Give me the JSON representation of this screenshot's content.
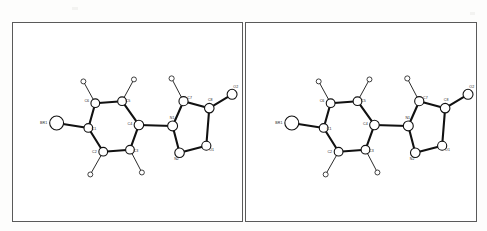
{
  "figure": {
    "type": "ortep-stereo-pair",
    "panel_count": 2,
    "background_color": "#fdfdfc",
    "frame_color": "#5a5a5a",
    "bond_color": "#111111",
    "atom_fill_color": "#ffffff"
  },
  "panels": [
    {
      "id": "panel-left",
      "name": "stereo-view-left"
    },
    {
      "id": "panel-right",
      "name": "stereo-view-right"
    }
  ],
  "molecule": {
    "labels": {
      "br1": "BR1",
      "c1": "C1",
      "c2": "C2",
      "c3": "C3",
      "c4": "C4",
      "c5": "C5",
      "c6": "C6",
      "c7": "C7",
      "c8": "C8",
      "n1": "N1",
      "n2": "N2",
      "o1": "O1",
      "o2": "O2"
    },
    "atoms": [
      {
        "key": "br1",
        "label": "BR1",
        "element": "Br",
        "radius": 7.0,
        "x": 44,
        "y": 101,
        "label_dx": -13,
        "label_dy": 1.2,
        "kind": "br"
      },
      {
        "key": "c1",
        "label": "C1",
        "element": "C",
        "radius": 4.4,
        "x": 76,
        "y": 106,
        "label_dx": 5.6,
        "label_dy": 2.2,
        "kind": "c"
      },
      {
        "key": "c6",
        "label": "C6",
        "element": "C",
        "radius": 4.4,
        "x": 83,
        "y": 81,
        "label_dx": -8.6,
        "label_dy": -1.0,
        "kind": "c"
      },
      {
        "key": "c5",
        "label": "C5",
        "element": "C",
        "radius": 4.4,
        "x": 110,
        "y": 79,
        "label_dx": 6.0,
        "label_dy": 0.5,
        "kind": "c"
      },
      {
        "key": "c4",
        "label": "C4",
        "element": "C",
        "radius": 4.8,
        "x": 127,
        "y": 103,
        "label_dx": -9.0,
        "label_dy": 0.5,
        "kind": "c"
      },
      {
        "key": "c3",
        "label": "C3",
        "element": "C",
        "radius": 4.4,
        "x": 118,
        "y": 128,
        "label_dx": 6.0,
        "label_dy": 2.4,
        "kind": "c"
      },
      {
        "key": "c2",
        "label": "C2",
        "element": "C",
        "radius": 4.4,
        "x": 91,
        "y": 130,
        "label_dx": -8.8,
        "label_dy": 1.0,
        "kind": "c"
      },
      {
        "key": "n1",
        "label": "N1",
        "element": "N",
        "radius": 5.0,
        "x": 161,
        "y": 104,
        "label_dx": -0.5,
        "label_dy": -7.4,
        "kind": "c"
      },
      {
        "key": "c7",
        "label": "C7",
        "element": "C",
        "radius": 4.6,
        "x": 172,
        "y": 79,
        "label_dx": 6.2,
        "label_dy": -1.8,
        "kind": "c"
      },
      {
        "key": "c8",
        "label": "C8",
        "element": "C",
        "radius": 4.8,
        "x": 198,
        "y": 86,
        "label_dx": 1.0,
        "label_dy": -7.2,
        "kind": "c"
      },
      {
        "key": "o1",
        "label": "O1",
        "element": "O",
        "radius": 4.6,
        "x": 195,
        "y": 124,
        "label_dx": 5.4,
        "label_dy": 4.8,
        "kind": "c"
      },
      {
        "key": "n2",
        "label": "N2",
        "element": "N",
        "radius": 4.8,
        "x": 168,
        "y": 131,
        "label_dx": -3.0,
        "label_dy": 7.6,
        "kind": "c"
      },
      {
        "key": "o2",
        "label": "O2",
        "element": "O",
        "radius": 5.0,
        "x": 221,
        "y": 72,
        "label_dx": 3.8,
        "label_dy": -6.0,
        "kind": "c"
      },
      {
        "key": "h6",
        "label": "",
        "element": "H",
        "radius": 2.5,
        "x": 71,
        "y": 59,
        "label_dx": 0,
        "label_dy": 0,
        "kind": "h"
      },
      {
        "key": "h5",
        "label": "",
        "element": "H",
        "radius": 2.5,
        "x": 122,
        "y": 57,
        "label_dx": 0,
        "label_dy": 0,
        "kind": "h"
      },
      {
        "key": "h3",
        "label": "",
        "element": "H",
        "radius": 2.5,
        "x": 130,
        "y": 151,
        "label_dx": 0,
        "label_dy": 0,
        "kind": "h"
      },
      {
        "key": "h2",
        "label": "",
        "element": "H",
        "radius": 2.5,
        "x": 78,
        "y": 153,
        "label_dx": 0,
        "label_dy": 0,
        "kind": "h"
      },
      {
        "key": "h7",
        "label": "",
        "element": "H",
        "radius": 2.6,
        "x": 160,
        "y": 56,
        "label_dx": 0,
        "label_dy": 0,
        "kind": "h"
      }
    ],
    "bonds": [
      {
        "from": "br1",
        "to": "c1",
        "weight": "heavy"
      },
      {
        "from": "c1",
        "to": "c6",
        "weight": "heavy"
      },
      {
        "from": "c6",
        "to": "c5",
        "weight": "heavy"
      },
      {
        "from": "c5",
        "to": "c4",
        "weight": "heavy"
      },
      {
        "from": "c4",
        "to": "c3",
        "weight": "heavy"
      },
      {
        "from": "c3",
        "to": "c2",
        "weight": "heavy"
      },
      {
        "from": "c2",
        "to": "c1",
        "weight": "heavy"
      },
      {
        "from": "c4",
        "to": "n1",
        "weight": "heavy"
      },
      {
        "from": "n1",
        "to": "c7",
        "weight": "heavy"
      },
      {
        "from": "c7",
        "to": "c8",
        "weight": "heavy"
      },
      {
        "from": "c8",
        "to": "o1",
        "weight": "heavy"
      },
      {
        "from": "o1",
        "to": "n2",
        "weight": "heavy"
      },
      {
        "from": "n2",
        "to": "n1",
        "weight": "heavy"
      },
      {
        "from": "c8",
        "to": "o2",
        "weight": "heavy"
      },
      {
        "from": "c6",
        "to": "h6",
        "weight": "light"
      },
      {
        "from": "c5",
        "to": "h5",
        "weight": "light"
      },
      {
        "from": "c3",
        "to": "h3",
        "weight": "light"
      },
      {
        "from": "c2",
        "to": "h2",
        "weight": "light"
      },
      {
        "from": "c7",
        "to": "h7",
        "weight": "light"
      }
    ]
  }
}
